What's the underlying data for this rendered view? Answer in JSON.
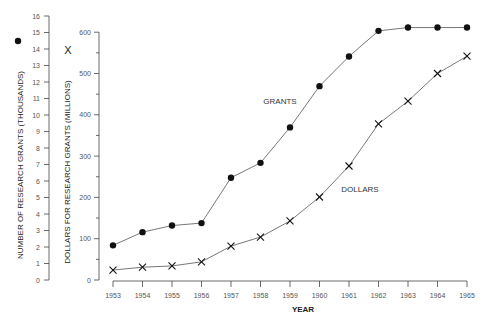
{
  "chart_data": {
    "type": "line",
    "title": "",
    "xlabel": "YEAR",
    "ylabel_left": "NUMBER OF RESEARCH GRANTS (THOUSANDS)",
    "ylabel_right": "DOLLARS FOR RESEARCH GRANTS (MILLIONS)",
    "x": [
      "1953",
      "1954",
      "1955",
      "1956",
      "1957",
      "1958",
      "1959",
      "1960",
      "1961",
      "1962",
      "1963",
      "1964",
      "1965"
    ],
    "series": [
      {
        "name": "GRANTS",
        "marker": "filled-circle",
        "axis": "left (thousands)",
        "values": [
          2.1,
          2.9,
          3.3,
          3.45,
          6.2,
          7.1,
          9.25,
          11.75,
          13.55,
          15.1,
          15.3,
          15.3,
          15.3
        ]
      },
      {
        "name": "DOLLARS",
        "marker": "x",
        "axis": "right (millions)",
        "values": [
          24,
          31,
          34,
          44,
          82,
          104,
          143,
          201,
          276,
          378,
          433,
          500,
          542
        ]
      }
    ],
    "y_left": {
      "ticks": [
        0,
        1,
        2,
        3,
        4,
        5,
        6,
        7,
        8,
        9,
        10,
        11,
        12,
        13,
        14,
        15,
        16
      ],
      "ylim": [
        0,
        16
      ]
    },
    "y_right": {
      "ticks": [
        0,
        100,
        200,
        300,
        400,
        500,
        600
      ],
      "ylim": [
        0,
        640
      ]
    },
    "legend": {
      "left_axis_marker": "●",
      "right_axis_marker": "X"
    },
    "annotations": [
      "GRANTS",
      "DOLLARS"
    ],
    "grid": false
  },
  "labels": {
    "year": "YEAR",
    "left_axis": "NUMBER OF RESEARCH GRANTS (THOUSANDS)",
    "right_axis": "DOLLARS FOR RESEARCH GRANTS (MILLIONS)",
    "grants": "GRANTS",
    "dollars": "DOLLARS",
    "dollars_marker": "X"
  }
}
